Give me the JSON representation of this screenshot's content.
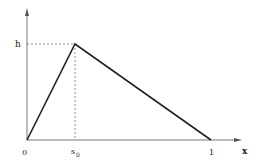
{
  "diagram": {
    "type": "triangular-function-plot",
    "axes": {
      "x_label": "x",
      "y_label": ""
    },
    "labels": {
      "origin": "0",
      "peak_x": "s",
      "peak_x_subscript": "0",
      "peak_y": "h",
      "end_x": "1"
    },
    "points": [
      {
        "name": "origin",
        "x": 0,
        "y": 0
      },
      {
        "name": "peak",
        "x": "s0",
        "y": "h"
      },
      {
        "name": "end",
        "x": 1,
        "y": 0
      }
    ],
    "colors": {
      "line": "#222222",
      "axis": "#555555",
      "dashed": "#666666"
    }
  }
}
